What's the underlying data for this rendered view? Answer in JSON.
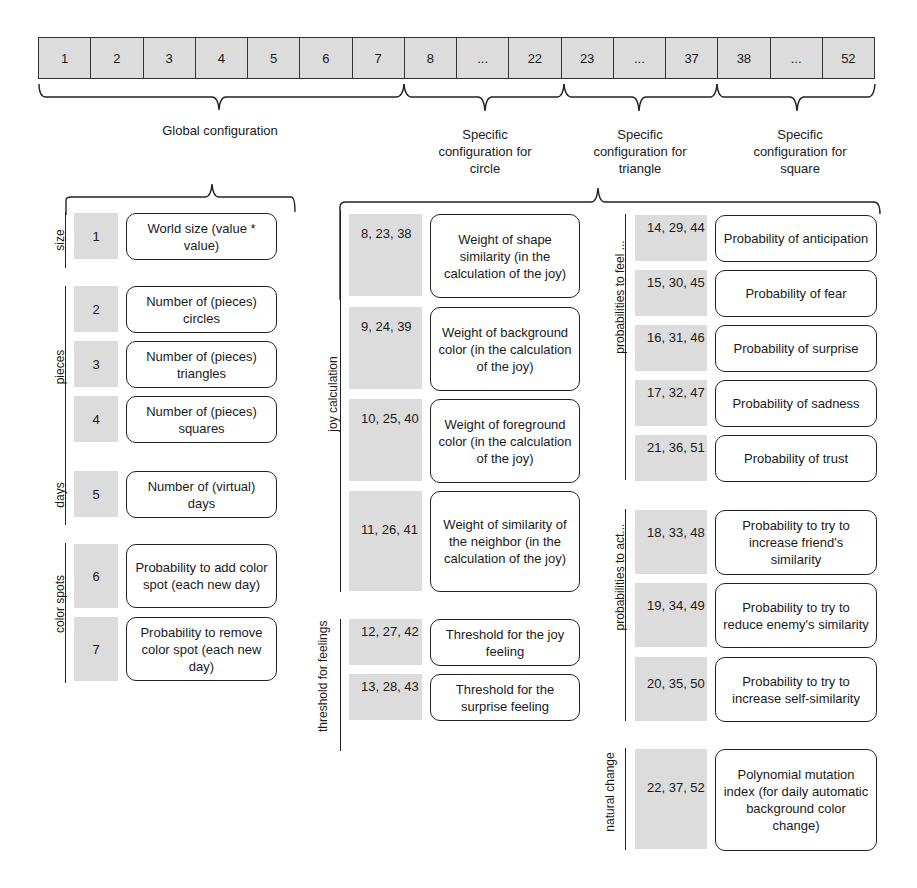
{
  "strip": {
    "cells": [
      "1",
      "2",
      "3",
      "4",
      "5",
      "6",
      "7",
      "8",
      "...",
      "22",
      "23",
      "...",
      "37",
      "38",
      "...",
      "52"
    ]
  },
  "groups": {
    "global": "Global configuration",
    "circle": "Specific configuration for circle",
    "triangle": "Specific configuration for triangle",
    "square": "Specific configuration for square"
  },
  "global_sections": [
    {
      "label": "size",
      "items": [
        {
          "index": "1",
          "desc": "World size (value * value)"
        }
      ]
    },
    {
      "label": "pieces",
      "items": [
        {
          "index": "2",
          "desc": "Number of (pieces) circles"
        },
        {
          "index": "3",
          "desc": "Number of (pieces) triangles"
        },
        {
          "index": "4",
          "desc": "Number of (pieces) squares"
        }
      ]
    },
    {
      "label": "days",
      "items": [
        {
          "index": "5",
          "desc": "Number of (virtual) days"
        }
      ]
    },
    {
      "label": "color spots",
      "items": [
        {
          "index": "6",
          "desc": "Probability to add color spot (each new day)"
        },
        {
          "index": "7",
          "desc": "Probability to remove color spot (each new day)"
        }
      ]
    }
  ],
  "specific_sections": [
    {
      "label": "joy calculation",
      "items": [
        {
          "index": "8, 23, 38",
          "desc": "Weight of shape similarity (in the calculation of the joy)"
        },
        {
          "index": "9, 24, 39",
          "desc": "Weight of background color (in the calculation of the joy)"
        },
        {
          "index": "10, 25, 40",
          "desc": "Weight of foreground color (in the calculation of the joy)"
        },
        {
          "index": "11, 26, 41",
          "desc": "Weight of similarity of the neighbor (in the calculation of the joy)"
        }
      ]
    },
    {
      "label": "threshold for feelings",
      "items": [
        {
          "index": "12, 27, 42",
          "desc": "Threshold for the joy feeling"
        },
        {
          "index": "13, 28, 43",
          "desc": "Threshold for the surprise feeling"
        }
      ]
    },
    {
      "label": "probabilities to feel ...",
      "items": [
        {
          "index": "14, 29, 44",
          "desc": "Probability of anticipation"
        },
        {
          "index": "15, 30, 45",
          "desc": "Probability of fear"
        },
        {
          "index": "16, 31, 46",
          "desc": "Probability of surprise"
        },
        {
          "index": "17, 32, 47",
          "desc": "Probability of sadness"
        },
        {
          "index": "21, 36, 51",
          "desc": "Probability of trust"
        }
      ]
    },
    {
      "label": "probabilities to act...",
      "items": [
        {
          "index": "18, 33, 48",
          "desc": "Probability to try to increase friend's similarity"
        },
        {
          "index": "19, 34, 49",
          "desc": "Probability to try to reduce enemy's similarity"
        },
        {
          "index": "20, 35, 50",
          "desc": "Probability to try to increase self-similarity"
        }
      ]
    },
    {
      "label": "natural change",
      "items": [
        {
          "index": "22, 37, 52",
          "desc": "Polynomial mutation index (for daily automatic background color change)"
        }
      ]
    }
  ],
  "colors": {
    "gene_fill": "#dcdcdc",
    "line": "#222222"
  }
}
